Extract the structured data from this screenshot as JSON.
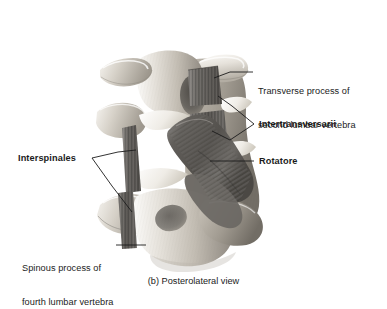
{
  "figure": {
    "caption": "(b) Posterolateral view",
    "view_name": "Posterolateral view",
    "panel_letter": "(b)",
    "background_color": "#ffffff",
    "line_color": "#1b1b1b",
    "text_color": "#1b1b1b"
  },
  "labels": [
    {
      "id": "transverse-process",
      "text": "Transverse process of\nsecond lumbar vertebra",
      "line1": "Transverse process of",
      "line2": "second lumbar vertebra",
      "bold": false,
      "side": "right"
    },
    {
      "id": "intertransversarii",
      "text": "Intertransversarii",
      "bold": true,
      "side": "right"
    },
    {
      "id": "rotatore",
      "text": "Rotatore",
      "bold": true,
      "side": "right"
    },
    {
      "id": "interspinales",
      "text": "Interspinales",
      "bold": true,
      "side": "left"
    },
    {
      "id": "spinous-process",
      "text": "Spinous process of\nfourth lumbar vertebra",
      "line1": "Spinous process of",
      "line2": "fourth lumbar vertebra",
      "bold": false,
      "side": "left"
    }
  ],
  "palette": {
    "bone_light": "#e9e6e0",
    "bone_mid": "#c9c4bb",
    "bone_shadow": "#9a948a",
    "bone_deep": "#6f6a62",
    "muscle_dark": "#5d5a56",
    "muscle_mid": "#7c7874",
    "muscle_light": "#9c9894",
    "tendon_white": "#f2f0ec",
    "outline": "#1b1b1b"
  }
}
